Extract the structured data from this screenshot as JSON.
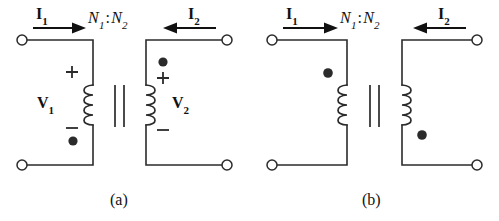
{
  "figure": {
    "background_color": "#ffffff",
    "line_color": "#2b2b2b",
    "arrow_color": "#111111"
  },
  "panels": [
    {
      "id": "a",
      "caption": "(a)",
      "turns_ratio": {
        "n1": "N",
        "n1_sub": "1",
        "colon": ":",
        "n2": "N",
        "n2_sub": "2"
      },
      "primary": {
        "current_label": "I",
        "current_sub": "1",
        "current_direction": "right",
        "voltage_label": "V",
        "voltage_sub": "1",
        "plus_sign": "+",
        "minus_sign": "−",
        "dot_position": "bottom"
      },
      "secondary": {
        "current_label": "I",
        "current_sub": "2",
        "current_direction": "left",
        "voltage_label": "V",
        "voltage_sub": "2",
        "plus_sign": "+",
        "minus_sign": "−",
        "dot_position": "top"
      },
      "terminal_count": 4,
      "coil_turns": 4
    },
    {
      "id": "b",
      "caption": "(b)",
      "turns_ratio": {
        "n1": "N",
        "n1_sub": "1",
        "colon": ":",
        "n2": "N",
        "n2_sub": "2"
      },
      "primary": {
        "current_label": "I",
        "current_sub": "1",
        "current_direction": "right",
        "voltage_label": "",
        "voltage_sub": "",
        "plus_sign": "",
        "minus_sign": "",
        "dot_position": "top"
      },
      "secondary": {
        "current_label": "I",
        "current_sub": "2",
        "current_direction": "left",
        "voltage_label": "",
        "voltage_sub": "",
        "plus_sign": "",
        "minus_sign": "",
        "dot_position": "bottom"
      },
      "terminal_count": 4,
      "coil_turns": 4
    }
  ]
}
